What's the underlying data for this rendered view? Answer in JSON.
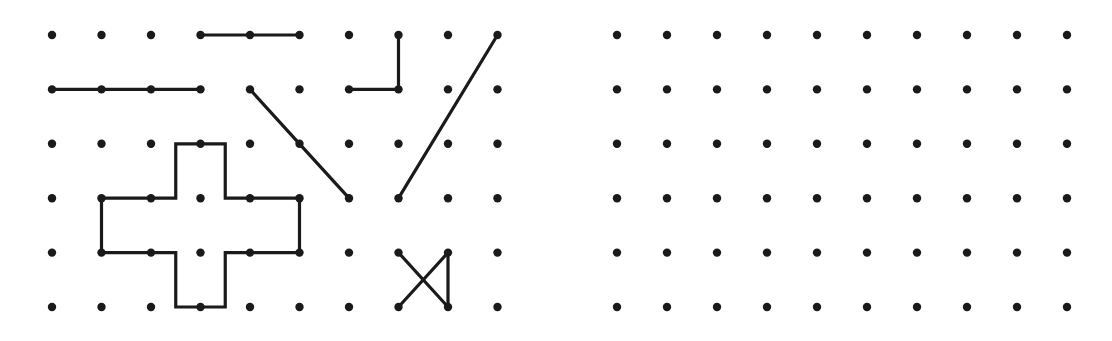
{
  "page": {
    "background_color": "#ffffff",
    "ink_color": "#1a1a1a",
    "width": 1112,
    "height": 341
  },
  "panels": [
    {
      "id": "left-panel",
      "name": "sample-figures-panel",
      "role": "stimulus",
      "grid": {
        "columns": 10,
        "rows": 6,
        "x_start": 52,
        "y_start": 35,
        "x_step": 49.5,
        "y_step": 54.4,
        "dot_radius": 4.2
      },
      "figures": [
        {
          "name": "short-horizontal-segment",
          "type": "polyline",
          "closed": false,
          "points": [
            [
              3,
              0
            ],
            [
              5,
              0
            ]
          ],
          "endpoints": 2
        },
        {
          "name": "long-horizontal-segment",
          "type": "polyline",
          "closed": false,
          "points": [
            [
              0,
              1
            ],
            [
              3,
              1
            ]
          ],
          "endpoints": 2
        },
        {
          "name": "corner-elbow",
          "type": "polyline",
          "closed": false,
          "points": [
            [
              7,
              0
            ],
            [
              7,
              1
            ],
            [
              6,
              1
            ]
          ],
          "endpoints": 2
        },
        {
          "name": "descending-diagonal",
          "type": "polyline",
          "closed": false,
          "points": [
            [
              4,
              1
            ],
            [
              5,
              2
            ],
            [
              6,
              3
            ]
          ],
          "endpoints": 2
        },
        {
          "name": "ascending-diagonal",
          "type": "polyline",
          "closed": false,
          "points": [
            [
              7,
              3
            ],
            [
              9,
              0
            ]
          ],
          "endpoints": 2
        },
        {
          "name": "plus-cross-polygon",
          "type": "polygon",
          "closed": true,
          "offset_points": [
            [
              2.5,
              2
            ],
            [
              3.5,
              2
            ],
            [
              3.5,
              3
            ],
            [
              5,
              3
            ],
            [
              5,
              4
            ],
            [
              3.5,
              4
            ],
            [
              3.5,
              5
            ],
            [
              2.5,
              5
            ],
            [
              2.5,
              4
            ],
            [
              1,
              4
            ],
            [
              1,
              3
            ],
            [
              2.5,
              3
            ]
          ]
        },
        {
          "name": "bowtie-triangle-pair",
          "type": "multiline",
          "closed": false,
          "segments": [
            [
              [
                7,
                4
              ],
              [
                8,
                5
              ]
            ],
            [
              [
                8,
                4
              ],
              [
                7,
                5
              ]
            ],
            [
              [
                8,
                4
              ],
              [
                8,
                5
              ]
            ]
          ]
        }
      ]
    },
    {
      "id": "right-panel",
      "name": "blank-response-panel",
      "role": "response",
      "grid": {
        "columns": 10,
        "rows": 6,
        "x_start": 617,
        "y_start": 35,
        "x_step": 50,
        "y_step": 54.4,
        "dot_radius": 4.2
      },
      "figures": []
    }
  ]
}
